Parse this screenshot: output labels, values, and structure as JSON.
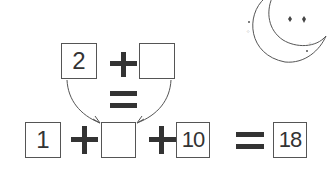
{
  "top_equation": {
    "left_box": "2",
    "right_box": ""
  },
  "bottom_equation": {
    "box1": "1",
    "box2": "",
    "box3": "10",
    "result_box": "18"
  },
  "colors": {
    "stroke": "#555555",
    "symbol": "#333333",
    "text": "#333333"
  },
  "icons": [
    "moon-icon",
    "star-icon",
    "sparkle-icon"
  ]
}
